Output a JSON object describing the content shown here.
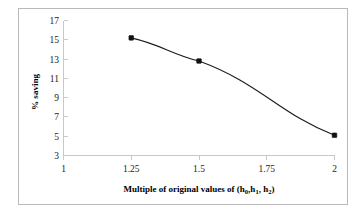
{
  "chart_data": {
    "type": "line",
    "title": "",
    "xlabel": "Multiple of original values of  (h0,h1, h2)",
    "xlabel_main": "Multiple of original values of  (h",
    "xlabel_parts": {
      "lead": "Multiple of original values of  (h",
      "sub0": "0",
      "mid1": ",h",
      "sub1": "1",
      "mid2": ", h",
      "sub2": "2",
      "tail": ")"
    },
    "ylabel": "% saving",
    "x": [
      1.25,
      1.5,
      2
    ],
    "values": [
      15.2,
      12.8,
      5.1
    ],
    "series": [
      {
        "name": "% saving",
        "x": [
          1.25,
          1.5,
          2
        ],
        "values": [
          15.2,
          12.8,
          5.1
        ]
      }
    ],
    "xlim": [
      1,
      2
    ],
    "ylim": [
      3,
      17
    ],
    "xticks": [
      "1",
      "1.25",
      "1.5",
      "1.75",
      "2"
    ],
    "xtick_values": [
      1,
      1.25,
      1.5,
      1.75,
      2
    ],
    "yticks": [
      "3",
      "5",
      "7",
      "9",
      "11",
      "13",
      "15",
      "17"
    ],
    "ytick_values": [
      3,
      5,
      7,
      9,
      11,
      13,
      15,
      17
    ],
    "grid": false,
    "legend": false,
    "legend_position": "none",
    "marker": "square",
    "line_color": "#1a1a1a",
    "marker_color": "#111111",
    "background_color": "#ffffff",
    "axis_color": "#c8c8c8",
    "frame_color": "#b9b9b9"
  }
}
